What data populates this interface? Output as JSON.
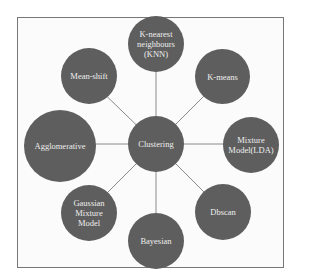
{
  "diagram": {
    "type": "hub-and-spoke",
    "center": {
      "label": "Clustering"
    },
    "nodes": [
      {
        "id": "knn",
        "label": "K-nearest neighbours (KNN)"
      },
      {
        "id": "kmeans",
        "label": "K-means"
      },
      {
        "id": "mixture",
        "label": "Mixture Model(LDA)"
      },
      {
        "id": "dbscan",
        "label": "Dbscan"
      },
      {
        "id": "bayesian",
        "label": "Bayesian"
      },
      {
        "id": "gmm",
        "label": "Gaussian Mixture Model"
      },
      {
        "id": "agglomerative",
        "label": "Agglomerative"
      },
      {
        "id": "meanshift",
        "label": "Mean-shift"
      }
    ],
    "colors": {
      "node_fill": "#5e5e5e",
      "node_text": "#eeeeee",
      "edge": "#8a8a8a",
      "frame": "#777777"
    }
  }
}
